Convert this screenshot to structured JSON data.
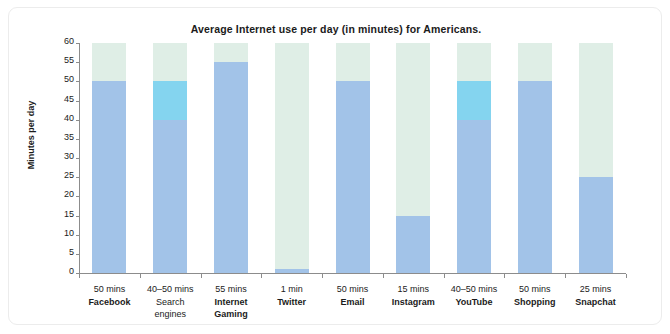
{
  "chart_data": {
    "type": "bar",
    "title": "Average Internet use per day (in minutes) for Americans.",
    "xlabel": "",
    "ylabel": "Minutes per day",
    "ylim": [
      0,
      60
    ],
    "ytick_step": 5,
    "yticks": [
      0,
      5,
      10,
      15,
      20,
      25,
      30,
      35,
      40,
      45,
      50,
      55,
      60
    ],
    "grid": false,
    "legend": "none",
    "bar_style": {
      "track_color": "#dfeee6",
      "fill_color": "#a2c3e8",
      "range_color": "#84d4ef",
      "note": "Each category is drawn as a full-height pale track (0-60). Solid blue fills to the lower value; a lighter cyan band spans the range for categories given as a range."
    },
    "categories": [
      "Facebook",
      "Search engines",
      "Internet Gaming",
      "Twitter",
      "Email",
      "Instagram",
      "YouTube",
      "Shopping",
      "Snapchat"
    ],
    "values": [
      50,
      45,
      55,
      1,
      50,
      15,
      45,
      50,
      25
    ],
    "value_labels": [
      "50 mins",
      "40–50 mins",
      "55 mins",
      "1 min",
      "50 mins",
      "15 mins",
      "40–50 mins",
      "50 mins",
      "25 mins"
    ],
    "points": [
      {
        "label": "Facebook",
        "label_lines": [
          "Facebook"
        ],
        "value_text": "50 mins",
        "low": 50,
        "high": 50,
        "is_range": false,
        "bold_label": true
      },
      {
        "label": "Search engines",
        "label_lines": [
          "Search engines"
        ],
        "value_text": "40–50 mins",
        "low": 40,
        "high": 50,
        "is_range": true,
        "bold_label": false
      },
      {
        "label": "Internet Gaming",
        "label_lines": [
          "Internet",
          "Gaming"
        ],
        "value_text": "55 mins",
        "low": 55,
        "high": 55,
        "is_range": false,
        "bold_label": true
      },
      {
        "label": "Twitter",
        "label_lines": [
          "Twitter"
        ],
        "value_text": "1 min",
        "low": 1,
        "high": 1,
        "is_range": false,
        "bold_label": true
      },
      {
        "label": "Email",
        "label_lines": [
          "Email"
        ],
        "value_text": "50 mins",
        "low": 50,
        "high": 50,
        "is_range": false,
        "bold_label": true
      },
      {
        "label": "Instagram",
        "label_lines": [
          "Instagram"
        ],
        "value_text": "15 mins",
        "low": 15,
        "high": 15,
        "is_range": false,
        "bold_label": true
      },
      {
        "label": "YouTube",
        "label_lines": [
          "YouTube"
        ],
        "value_text": "40–50 mins",
        "low": 40,
        "high": 50,
        "is_range": true,
        "bold_label": true
      },
      {
        "label": "Shopping",
        "label_lines": [
          "Shopping"
        ],
        "value_text": "50 mins",
        "low": 50,
        "high": 50,
        "is_range": false,
        "bold_label": true
      },
      {
        "label": "Snapchat",
        "label_lines": [
          "Snapchat"
        ],
        "value_text": "25 mins",
        "low": 25,
        "high": 25,
        "is_range": false,
        "bold_label": true
      }
    ]
  }
}
